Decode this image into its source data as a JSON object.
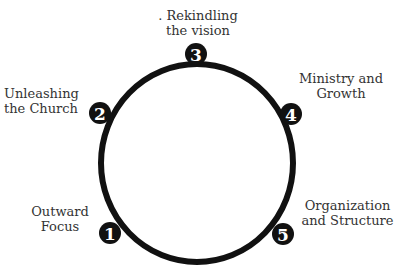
{
  "diagram": {
    "type": "cycle",
    "ring_color": "#111111",
    "badge_color": "#111111",
    "badge_text_color": "#ffffff",
    "steps": [
      {
        "number": "1",
        "line1": "Outward",
        "line2": "Focus"
      },
      {
        "number": "2",
        "line1": "Unleashing",
        "line2": "the Church"
      },
      {
        "number": "3",
        "line1": ". Rekindling",
        "line2": "the vision"
      },
      {
        "number": "4",
        "line1": "Ministry and",
        "line2": "Growth"
      },
      {
        "number": "5",
        "line1": "Organization",
        "line2": "and Structure"
      }
    ]
  }
}
